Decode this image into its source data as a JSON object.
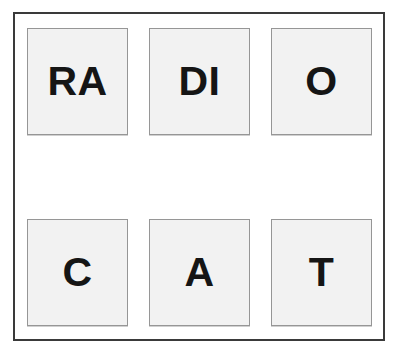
{
  "worksheet": {
    "background_color": "#ffffff",
    "frame_color": "#3a3a3a",
    "tile_fill_color": "#f2f2f2",
    "tile_border_color": "#969696",
    "letter_color": "#151515"
  },
  "tiles": [
    {
      "letters": "RA",
      "row": 1,
      "column": 1
    },
    {
      "letters": "DI",
      "row": 1,
      "column": 2
    },
    {
      "letters": "O",
      "row": 1,
      "column": 3
    },
    {
      "letters": "C",
      "row": 2,
      "column": 1
    },
    {
      "letters": "A",
      "row": 2,
      "column": 2
    },
    {
      "letters": "T",
      "row": 2,
      "column": 3
    }
  ]
}
